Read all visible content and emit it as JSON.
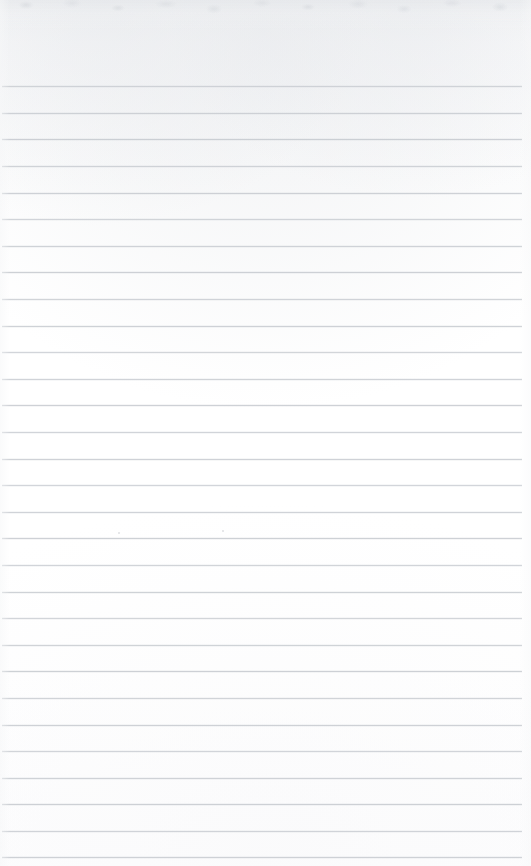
{
  "page": {
    "kind": "scanned-ruled-notepad-page",
    "width": 531,
    "height": 866,
    "background_color": "#fdfdfd",
    "paper_color": "#ffffff",
    "has_text_content": false,
    "has_handwriting": false,
    "has_vertical_margin_rule": false,
    "caption": ""
  },
  "ruling": {
    "line_color": "#c3c7ce",
    "line_thickness_px": 1,
    "line_opacity": 0.82,
    "line_count": 30,
    "first_line_y": 86,
    "line_spacing_px": 26.6,
    "line_start_x": 2,
    "line_end_x": 522,
    "left_margin_px": 2,
    "right_margin_px": 9,
    "top_margin_px": 86,
    "bottom_margin_px": 9,
    "line_y_positions": [
      86,
      113,
      139,
      166,
      193,
      219,
      246,
      272,
      299,
      326,
      352,
      379,
      405,
      432,
      459,
      485,
      512,
      538,
      565,
      592,
      618,
      645,
      671,
      698,
      725,
      751,
      778,
      804,
      831,
      857
    ]
  },
  "scan_artifacts": {
    "top_edge_noise_color": "#e2e4e8",
    "top_edge_noise_height_px": 30,
    "specks": [
      {
        "x": 222,
        "y": 530
      },
      {
        "x": 118,
        "y": 532
      }
    ]
  }
}
